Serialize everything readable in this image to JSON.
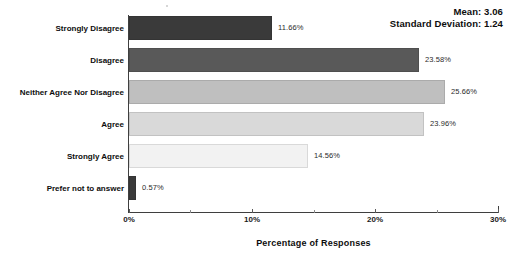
{
  "stats": {
    "mean_label": "Mean: 3.06",
    "sd_label": "Standard Deviation: 1.24"
  },
  "axis": {
    "title": "Percentage of Responses",
    "ticks": [
      "0%",
      "10%",
      "20%",
      "30%"
    ]
  },
  "chart_data": {
    "type": "bar",
    "orientation": "horizontal",
    "title": "",
    "subtitle": "",
    "xlabel": "Percentage of Responses",
    "ylabel": "",
    "xlim": [
      0,
      30
    ],
    "xticks": [
      0,
      10,
      20,
      30
    ],
    "xtick_labels": [
      "0%",
      "10%",
      "20%",
      "30%"
    ],
    "minor_xticks": [
      5,
      15,
      25
    ],
    "grid": false,
    "legend": "none",
    "categories": [
      "Strongly Disagree",
      "Disagree",
      "Neither Agree Nor Disagree",
      "Agree",
      "Strongly Agree",
      "Prefer not to answer"
    ],
    "values": [
      11.66,
      23.58,
      25.66,
      23.96,
      14.56,
      0.57
    ],
    "value_labels": [
      "11.66%",
      "23.58%",
      "25.66%",
      "23.96%",
      "14.56%",
      "0.57%"
    ],
    "bar_colors": [
      "#3a3a3a",
      "#595959",
      "#bfbfbf",
      "#d9d9d9",
      "#f2f2f2",
      "#3a3a3a"
    ],
    "annotations": [
      "Mean: 3.06",
      "Standard Deviation: 1.24"
    ]
  },
  "bars": [
    {
      "label": "Strongly Disagree",
      "value_label": "11.66%",
      "width_px": 143,
      "top_px": 16,
      "color": "#3a3a3a"
    },
    {
      "label": "Disagree",
      "value_label": "23.58%",
      "width_px": 290,
      "top_px": 48,
      "color": "#595959"
    },
    {
      "label": "Neither Agree Nor Disagree",
      "value_label": "25.66%",
      "width_px": 316,
      "top_px": 80,
      "color": "#bfbfbf"
    },
    {
      "label": "Agree",
      "value_label": "23.96%",
      "width_px": 295,
      "top_px": 112,
      "color": "#d9d9d9"
    },
    {
      "label": "Strongly Agree",
      "value_label": "14.56%",
      "width_px": 179,
      "top_px": 144,
      "color": "#f2f2f2"
    },
    {
      "label": "Prefer not to answer",
      "value_label": "0.57%",
      "width_px": 7,
      "top_px": 176,
      "color": "#3a3a3a"
    }
  ],
  "ticks": [
    {
      "label": "0%",
      "x_px": 129,
      "major": true
    },
    {
      "label": "",
      "x_px": 190,
      "major": false
    },
    {
      "label": "10%",
      "x_px": 252,
      "major": true
    },
    {
      "label": "",
      "x_px": 314,
      "major": false
    },
    {
      "label": "20%",
      "x_px": 375,
      "major": true
    },
    {
      "label": "",
      "x_px": 437,
      "major": false
    },
    {
      "label": "30%",
      "x_px": 498,
      "major": true
    }
  ]
}
